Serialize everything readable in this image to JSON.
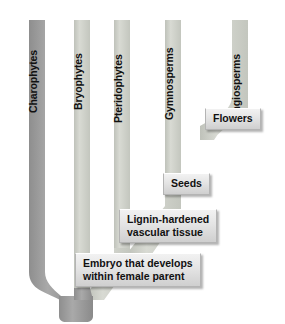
{
  "diagram": {
    "background_color": "#ffffff",
    "taxa": [
      {
        "name": "Charophytes",
        "label": "Charophytes",
        "color": "#9c9c9c",
        "x": 37
      },
      {
        "name": "Bryophytes",
        "label": "Bryophytes",
        "color": "#c9cbc4",
        "x": 82
      },
      {
        "name": "Pteridophytes",
        "label": "Pteridophytes",
        "color": "#cdcfc8",
        "x": 122
      },
      {
        "name": "Gymnosperms",
        "label": "Gymnosperms",
        "color": "#cdcfc8",
        "x": 172
      },
      {
        "name": "Angiosperms",
        "label": "Angiosperms",
        "color": "#cdcfc8",
        "x": 240
      }
    ],
    "traits": [
      {
        "name": "flowers",
        "label": "Flowers",
        "node": "gymnosperm-angiosperm-split"
      },
      {
        "name": "seeds",
        "label": "Seeds",
        "node": "seed-plant-node"
      },
      {
        "name": "vascular-tissue",
        "label": "Lignin-hardened\nvascular tissue",
        "node": "vascular-plant-node"
      },
      {
        "name": "embryo",
        "label": "Embryo that develops\nwithin female parent",
        "node": "land-plant-node"
      }
    ],
    "colors": {
      "charophyte_branch": "#9c9c9c",
      "land_plant_branch": "#cdcfc8",
      "trunk": "#9c9c9c",
      "box_fill_top": "#f2f2f2",
      "box_fill_bottom": "#cfcfcf",
      "box_border": "#b4b4b4",
      "text": "#111111"
    }
  }
}
